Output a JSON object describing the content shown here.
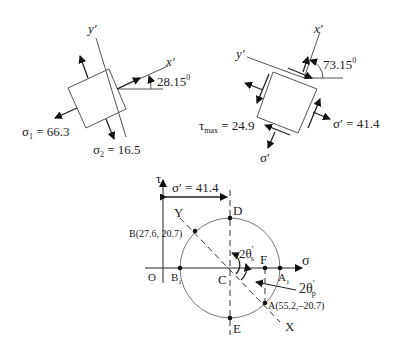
{
  "element1": {
    "axis_y_label": "y′",
    "axis_x_label": "x′",
    "angle_label": "28.15",
    "angle_sup": "0",
    "sigma1_sym": "σ",
    "sigma1_sub": "1",
    "sigma1_value": " = 66.3",
    "sigma2_sym": "σ",
    "sigma2_sub": "2",
    "sigma2_value": " = 16.5"
  },
  "element2": {
    "axis_y_label": "y′",
    "axis_x_label": "x′",
    "angle_label": "73.15",
    "angle_sup": "0",
    "tau_sym": "τ",
    "tau_sub": "max",
    "tau_value": " = 24.9",
    "sigma_prime_right": "σ′ = 41.4",
    "sigma_prime_bottom": "σ′"
  },
  "mohr": {
    "tau_axis": "τ",
    "sigma_axis": "σ",
    "dimension_label": "σ′ = 41.4",
    "origin": "O",
    "center": "C",
    "point_D": "D",
    "point_E": "E",
    "point_F": "F",
    "point_B1": "B",
    "point_B1_sub": "1",
    "point_A1": "A",
    "point_A1_sub": "1",
    "point_B": "B(27.6, 20.7)",
    "point_A": "A(55.2,–20.7)",
    "line_X": "X",
    "line_Y": "Y",
    "angle_s": "2θ",
    "angle_s_sub": "s",
    "angle_s_prime": "′",
    "angle_p": "2θ",
    "angle_p_sub": "p",
    "angle_p_prime": "′"
  }
}
